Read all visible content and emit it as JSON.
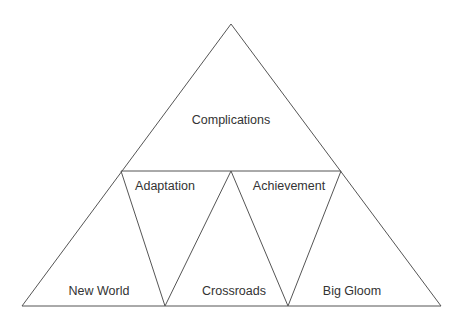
{
  "diagram": {
    "type": "triangle-subdivision",
    "line_color": "#555555",
    "text_color": "#333333",
    "outer_triangle": {
      "apex": [
        231,
        24
      ],
      "bottom_left": [
        22,
        306
      ],
      "bottom_right": [
        441,
        306
      ]
    },
    "mid_line": {
      "left": [
        121,
        171
      ],
      "right": [
        341,
        171
      ]
    },
    "inner_vertices": {
      "mid_top_center": [
        231,
        171
      ],
      "bottom_inner_left": [
        165,
        306
      ],
      "bottom_inner_right": [
        288,
        306
      ]
    },
    "regions": [
      {
        "id": "complications",
        "label": "Complications",
        "position": [
          231,
          120
        ]
      },
      {
        "id": "adaptation",
        "label": "Adaptation",
        "position": [
          165,
          186
        ]
      },
      {
        "id": "achievement",
        "label": "Achievement",
        "position": [
          289,
          186
        ]
      },
      {
        "id": "new-world",
        "label": "New World",
        "position": [
          99,
          291
        ]
      },
      {
        "id": "crossroads",
        "label": "Crossroads",
        "position": [
          234,
          291
        ]
      },
      {
        "id": "big-gloom",
        "label": "Big Gloom",
        "position": [
          352,
          291
        ]
      }
    ]
  }
}
